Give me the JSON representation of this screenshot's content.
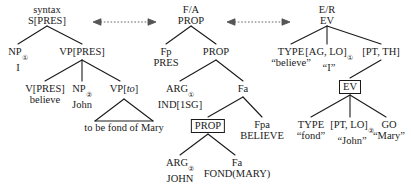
{
  "diagram": {
    "arrows": [
      {
        "name": "syntax-to-fa",
        "symbol": "⟷"
      },
      {
        "name": "fa-to-er",
        "symbol": "⟷"
      }
    ],
    "panels": {
      "syntax": {
        "tier_label": "syntax",
        "root": "S[PRES]"
      },
      "fa": {
        "tier_label": "F/A",
        "root": "PROP"
      },
      "er": {
        "tier_label": "E/R",
        "root": "EV"
      }
    }
  },
  "nodes": {
    "syntax_tier": "syntax",
    "syntax_root": "S[PRES]",
    "np1_label": "NP",
    "np1_sub": "①",
    "np1_word": "I",
    "vp_pres": "VP[PRES]",
    "v_pres": "V[PRES]",
    "v_pres_word": "believe",
    "np2_label": "NP",
    "np2_sub": "②",
    "np2_word": "John",
    "vp_to_pre": "VP[",
    "vp_to_ital": "to",
    "vp_to_post": "]",
    "triangle_text": "to be fond of Mary",
    "fa_tier": "F/A",
    "fa_root": "PROP",
    "fp": "Fp",
    "fp_word": "PRES",
    "prop2": "PROP",
    "arg1_label": "ARG",
    "arg1_sub": "①",
    "arg1_word": "IND[1SG]",
    "fa_node": "Fa",
    "prop_boxed": "PROP",
    "fpa": "Fpa",
    "fpa_word": "BELIEVE",
    "arg2_label": "ARG",
    "arg2_sub": "②",
    "arg2_word": "JOHN",
    "fa_node2": "Fa",
    "fa_node2_word": "FOND(MARY)",
    "er_tier": "E/R",
    "er_root": "EV",
    "type1": "TYPE",
    "type1_word": "“believe”",
    "aglo_label": "[AG, LO]",
    "aglo_sub": "①",
    "aglo_word": "“I”",
    "ptth": "[PT, TH]",
    "ev_boxed": "EV",
    "type2": "TYPE",
    "type2_word": "“fond”",
    "ptlo_label": "[PT, LO]",
    "ptlo_sub": "②",
    "ptlo_word": "“John”",
    "go": "GO",
    "go_word": "“Mary”"
  }
}
